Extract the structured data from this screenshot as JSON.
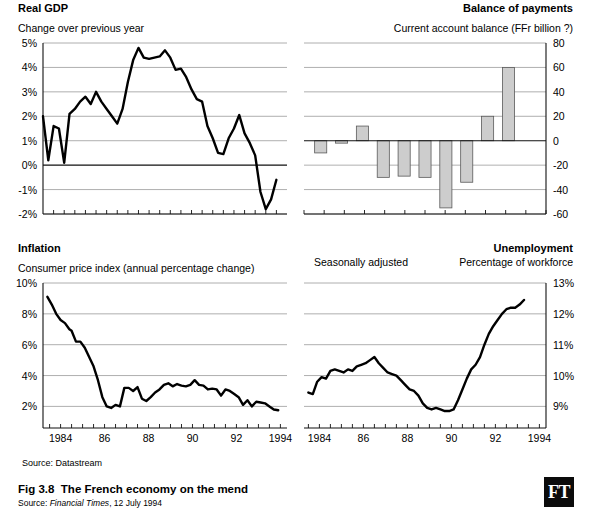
{
  "figure": {
    "caption_label": "Fig 3.8",
    "caption_text": "The French economy on the mend",
    "source_prefix": "Source:",
    "source_publication": "Financial Times",
    "source_date": ", 12 July 1994",
    "data_source_note": "Source: Datastream",
    "logo_text": "FT",
    "logo_name": "financial-times-logo"
  },
  "panels": {
    "gdp": {
      "title": "Real GDP",
      "subtitle_left": "Change over previous year",
      "subtitle_right": ""
    },
    "bop": {
      "title": "Balance of payments",
      "subtitle_left": "",
      "subtitle_right": "Current account balance (FFr billion ?)"
    },
    "inflation": {
      "title": "Inflation",
      "subtitle_left": "Consumer price index (annual percentage change)",
      "subtitle_right": ""
    },
    "unemployment": {
      "title": "Unemployment",
      "subtitle_left": "Seasonally adjusted",
      "subtitle_right": "Percentage of workforce"
    }
  },
  "chart_data": [
    {
      "id": "gdp",
      "type": "line",
      "title": "Real GDP",
      "subtitle": "Change over previous year",
      "xlabel": "",
      "ylabel": "Change over previous year",
      "ylim": [
        -2,
        5
      ],
      "xlim": [
        1983.0,
        1994.5
      ],
      "yticks": [
        5,
        4,
        3,
        2,
        1,
        0,
        -1,
        -2
      ],
      "ytick_labels": [
        "5%",
        "4%",
        "3%",
        "2%",
        "1%",
        "0%",
        "-1%",
        "-2%"
      ],
      "xticks": [
        1983.5,
        1984,
        1984.5,
        1985,
        1985.5,
        1986,
        1986.5,
        1987,
        1987.5,
        1988,
        1988.5,
        1989,
        1989.5,
        1990,
        1990.5,
        1991,
        1991.5,
        1992,
        1992.5,
        1993,
        1993.5,
        1994
      ],
      "xtick_labels": [],
      "grid": true,
      "zero_line": 0,
      "y_axis_side": "left",
      "x": [
        1983.0,
        1983.25,
        1983.5,
        1983.75,
        1984.0,
        1984.25,
        1984.5,
        1984.75,
        1985.0,
        1985.25,
        1985.5,
        1985.75,
        1986.0,
        1986.25,
        1986.5,
        1986.75,
        1987.0,
        1987.25,
        1987.5,
        1987.75,
        1988.0,
        1988.25,
        1988.5,
        1988.75,
        1989.0,
        1989.25,
        1989.5,
        1989.75,
        1990.0,
        1990.25,
        1990.5,
        1990.75,
        1991.0,
        1991.25,
        1991.5,
        1991.75,
        1992.0,
        1992.25,
        1992.5,
        1992.75,
        1993.0,
        1993.25,
        1993.5,
        1993.75,
        1994.0
      ],
      "values": [
        2.0,
        0.2,
        1.6,
        1.5,
        0.1,
        2.1,
        2.3,
        2.6,
        2.8,
        2.5,
        3.0,
        2.6,
        2.3,
        2.0,
        1.7,
        2.3,
        3.4,
        4.3,
        4.8,
        4.4,
        4.35,
        4.4,
        4.45,
        4.7,
        4.4,
        3.9,
        3.95,
        3.6,
        3.1,
        2.7,
        2.6,
        1.6,
        1.1,
        0.5,
        0.45,
        1.1,
        1.5,
        2.05,
        1.3,
        0.9,
        0.4,
        -1.1,
        -1.8,
        -1.4,
        -0.6,
        1.0
      ],
      "units": "percent"
    },
    {
      "id": "bop",
      "type": "bar",
      "title": "Balance of payments",
      "subtitle": "Current account balance (FFr billion ?)",
      "xlabel": "",
      "ylabel": "FFr billion",
      "ylim": [
        -60,
        80
      ],
      "yticks": [
        80,
        60,
        40,
        20,
        0,
        -20,
        -40,
        -60
      ],
      "ytick_labels": [
        "80",
        "60",
        "40",
        "20",
        "0",
        "-20",
        "-40",
        "-60"
      ],
      "grid": true,
      "zero_line": 0,
      "y_axis_side": "right",
      "categories": [
        "1983",
        "1984",
        "1985",
        "1986",
        "1987",
        "1988",
        "1989",
        "1990",
        "1991",
        "1992",
        "1993"
      ],
      "values": [
        -10,
        -2,
        12,
        -30,
        -29,
        -30,
        -55,
        -34,
        20,
        60,
        0
      ],
      "units": "FFr billion"
    },
    {
      "id": "inflation",
      "type": "line",
      "title": "Inflation",
      "subtitle": "Consumer price index (annual percentage change)",
      "xlabel": "",
      "ylabel": "Annual percentage change",
      "ylim": [
        0.6,
        10
      ],
      "xlim": [
        1983.2,
        1994.3
      ],
      "yticks": [
        10,
        8,
        6,
        4,
        2
      ],
      "ytick_labels": [
        "10%",
        "8%",
        "6%",
        "4%",
        "2%"
      ],
      "xticks": [
        1984,
        1985,
        1986,
        1987,
        1988,
        1989,
        1990,
        1991,
        1992,
        1993,
        1994
      ],
      "xtick_labels": [
        "1984",
        "",
        "86",
        "",
        "88",
        "",
        "90",
        "",
        "92",
        "",
        "1994"
      ],
      "grid": true,
      "y_axis_side": "left",
      "x": [
        1983.4,
        1983.6,
        1983.8,
        1984.0,
        1984.2,
        1984.4,
        1984.5,
        1984.7,
        1984.9,
        1985.1,
        1985.3,
        1985.5,
        1985.7,
        1985.9,
        1986.1,
        1986.3,
        1986.5,
        1986.7,
        1986.9,
        1987.1,
        1987.3,
        1987.5,
        1987.7,
        1987.9,
        1988.1,
        1988.3,
        1988.5,
        1988.7,
        1988.9,
        1989.1,
        1989.3,
        1989.5,
        1989.7,
        1989.9,
        1990.1,
        1990.3,
        1990.5,
        1990.7,
        1990.9,
        1991.1,
        1991.3,
        1991.5,
        1991.7,
        1991.9,
        1992.1,
        1992.3,
        1992.5,
        1992.7,
        1992.9,
        1993.1,
        1993.3,
        1993.5,
        1993.7,
        1993.9
      ],
      "values": [
        9.1,
        8.6,
        8.0,
        7.6,
        7.4,
        7.0,
        6.9,
        6.2,
        6.2,
        5.8,
        5.2,
        4.6,
        3.7,
        2.6,
        2.0,
        1.9,
        2.1,
        2.0,
        3.2,
        3.2,
        3.0,
        3.25,
        2.5,
        2.35,
        2.6,
        2.9,
        3.1,
        3.4,
        3.5,
        3.3,
        3.45,
        3.35,
        3.3,
        3.4,
        3.7,
        3.4,
        3.35,
        3.1,
        3.15,
        3.1,
        2.7,
        3.1,
        3.0,
        2.8,
        2.6,
        2.1,
        2.4,
        2.0,
        2.3,
        2.25,
        2.2,
        2.0,
        1.8,
        1.75
      ],
      "units": "percent"
    },
    {
      "id": "unemployment",
      "type": "line",
      "title": "Unemployment",
      "subtitle_left": "Seasonally adjusted",
      "subtitle_right": "Percentage of workforce",
      "xlabel": "",
      "ylabel": "Percentage of workforce",
      "ylim": [
        8.3,
        13
      ],
      "xlim": [
        1983.3,
        1994.3
      ],
      "yticks": [
        13,
        12,
        11,
        10,
        9
      ],
      "ytick_labels": [
        "13%",
        "12%",
        "11%",
        "10%",
        "9%"
      ],
      "xticks": [
        1984,
        1985,
        1986,
        1987,
        1988,
        1989,
        1990,
        1991,
        1992,
        1993,
        1994
      ],
      "xtick_labels": [
        "1984",
        "",
        "86",
        "",
        "88",
        "",
        "90",
        "",
        "92",
        "",
        "1994"
      ],
      "grid": true,
      "y_axis_side": "right",
      "x": [
        1983.5,
        1983.7,
        1983.9,
        1984.1,
        1984.3,
        1984.5,
        1984.7,
        1984.9,
        1985.1,
        1985.3,
        1985.5,
        1985.7,
        1985.9,
        1986.1,
        1986.3,
        1986.5,
        1986.7,
        1986.9,
        1987.1,
        1987.3,
        1987.5,
        1987.7,
        1987.9,
        1988.1,
        1988.3,
        1988.5,
        1988.7,
        1988.9,
        1989.1,
        1989.3,
        1989.5,
        1989.7,
        1989.9,
        1990.1,
        1990.3,
        1990.5,
        1990.7,
        1990.9,
        1991.1,
        1991.3,
        1991.5,
        1991.7,
        1991.9,
        1992.1,
        1992.3,
        1992.5,
        1992.7,
        1992.9,
        1993.1,
        1993.3,
        1993.5,
        1993.7,
        1993.9
      ],
      "values": [
        9.45,
        9.4,
        9.8,
        9.95,
        9.9,
        10.15,
        10.2,
        10.15,
        10.1,
        10.2,
        10.15,
        10.3,
        10.35,
        10.4,
        10.5,
        10.6,
        10.4,
        10.25,
        10.1,
        10.05,
        10.0,
        9.85,
        9.7,
        9.55,
        9.5,
        9.35,
        9.1,
        8.95,
        8.9,
        8.95,
        8.9,
        8.85,
        8.85,
        8.9,
        9.2,
        9.55,
        9.9,
        10.2,
        10.35,
        10.6,
        11.0,
        11.35,
        11.6,
        11.8,
        12.0,
        12.15,
        12.2,
        12.2,
        12.3,
        12.45
      ],
      "units": "percent"
    }
  ]
}
